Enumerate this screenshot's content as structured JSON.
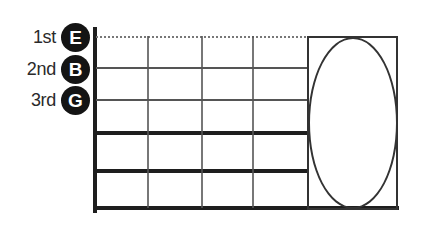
{
  "strings": [
    {
      "ordinal": "1st",
      "note": "E"
    },
    {
      "ordinal": "2nd",
      "note": "B"
    },
    {
      "ordinal": "3rd",
      "note": "G"
    }
  ],
  "colors": {
    "background": "#ffffff",
    "label_text": "#2a2a2a",
    "circle_bg": "#141414",
    "circle_text": "#ffffff",
    "line_thin": "#555555",
    "line_dotted": "#777777",
    "line_thick": "#1e1e1e",
    "box_stroke": "#333333"
  }
}
